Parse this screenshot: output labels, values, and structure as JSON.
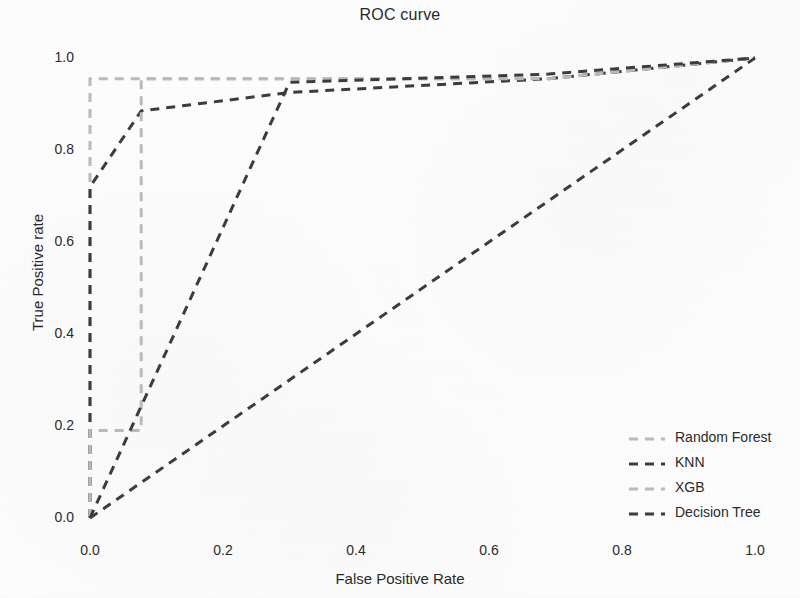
{
  "chart_data": {
    "type": "line",
    "title": "ROC curve",
    "xlabel": "False Positive Rate",
    "ylabel": "True Positive rate",
    "xlim": [
      -0.03,
      1.05
    ],
    "ylim": [
      -0.03,
      1.05
    ],
    "grid": false,
    "legend_position": "lower right",
    "xticks": [
      0.0,
      0.2,
      0.4,
      0.6,
      0.8,
      1.0
    ],
    "xtick_labels": [
      "0.0",
      "0.2",
      "0.4",
      "0.6",
      "0.8",
      "1.0"
    ],
    "yticks": [
      0.0,
      0.2,
      0.4,
      0.6,
      0.8,
      1.0
    ],
    "ytick_labels": [
      "0.0",
      "0.2",
      "0.4",
      "0.6",
      "0.8",
      "1.0"
    ],
    "series": [
      {
        "name": "Random Forest",
        "color": "#b9b9b9",
        "linestyle": "dashed",
        "x": [
          0.0,
          0.0,
          0.0,
          0.69,
          1.0
        ],
        "y": [
          0.0,
          0.19,
          0.955,
          0.955,
          1.0
        ]
      },
      {
        "name": "KNN",
        "color": "#3c3c3c",
        "linestyle": "dashed",
        "x": [
          0.0,
          0.0,
          0.077,
          0.077,
          0.3,
          0.69,
          1.0
        ],
        "y": [
          0.0,
          0.72,
          0.885,
          0.885,
          0.925,
          0.955,
          1.0
        ]
      },
      {
        "name": "XGB",
        "color": "#b9b9b9",
        "linestyle": "dashed",
        "x": [
          0.0,
          0.0,
          0.077,
          0.077,
          0.69,
          1.0
        ],
        "y": [
          0.0,
          0.19,
          0.19,
          0.955,
          0.955,
          1.0
        ]
      },
      {
        "name": "Decision Tree",
        "color": "#3c3c3c",
        "linestyle": "dashed",
        "x": [
          0.0,
          0.3,
          0.69,
          1.0
        ],
        "y": [
          0.0,
          0.947,
          0.965,
          1.0
        ]
      },
      {
        "name": "Decision Tree diagonal",
        "color": "#3c3c3c",
        "linestyle": "dashed",
        "x": [
          0.0,
          1.0
        ],
        "y": [
          0.0,
          1.0
        ]
      }
    ]
  },
  "legend": {
    "items": [
      {
        "label": "Random Forest",
        "color": "#b9b9b9"
      },
      {
        "label": "KNN",
        "color": "#3c3c3c"
      },
      {
        "label": "XGB",
        "color": "#b9b9b9"
      },
      {
        "label": "Decision Tree",
        "color": "#3c3c3c"
      }
    ]
  }
}
